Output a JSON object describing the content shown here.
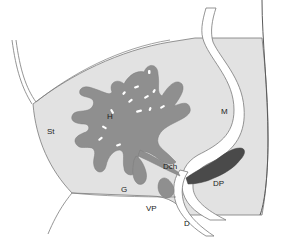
{
  "diagram": {
    "type": "anatomical-illustration",
    "colors": {
      "background": "#ffffff",
      "tissue_fill": "#e2e2e2",
      "organ_fill": "#8f8f8f",
      "dorsal_pancreas_fill": "#4a4a4a",
      "outline": "#7a7a7a",
      "lumen": "#ffffff"
    },
    "labels": [
      {
        "id": "st",
        "text": "St",
        "x": 47,
        "y": 128
      },
      {
        "id": "h",
        "text": "H",
        "x": 107,
        "y": 113
      },
      {
        "id": "m",
        "text": "M",
        "x": 221,
        "y": 108
      },
      {
        "id": "dch",
        "text": "Dch",
        "x": 163,
        "y": 163
      },
      {
        "id": "g",
        "text": "G",
        "x": 121,
        "y": 186
      },
      {
        "id": "dp",
        "text": "DP",
        "x": 213,
        "y": 180
      },
      {
        "id": "vp",
        "text": "VP",
        "x": 146,
        "y": 205
      },
      {
        "id": "d",
        "text": "D",
        "x": 184,
        "y": 220
      }
    ]
  }
}
